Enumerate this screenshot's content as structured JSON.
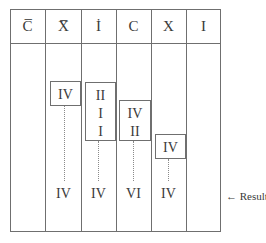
{
  "headers": [
    "C̅",
    "X̅",
    "İ",
    "C",
    "X",
    "I"
  ],
  "boxes": [
    {
      "column": 2,
      "lines": [
        "IV"
      ]
    },
    {
      "column": 3,
      "lines": [
        "II",
        "I",
        "I"
      ]
    },
    {
      "column": 4,
      "lines": [
        "IV",
        "II"
      ]
    },
    {
      "column": 5,
      "lines": [
        "IV"
      ]
    }
  ],
  "results": [
    "",
    "IV",
    "IV",
    "VI",
    "IV",
    ""
  ],
  "result_label": "← Result"
}
